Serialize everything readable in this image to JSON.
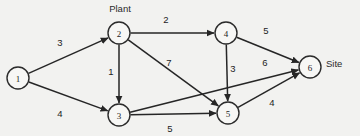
{
  "diagram": {
    "background_color": "#f2f2f0",
    "node_fill": "#f7f7f5",
    "stroke_color": "#262626",
    "annotations": [
      {
        "id": "plant",
        "text": "Plant",
        "x": 120,
        "y": 8
      },
      {
        "id": "site",
        "text": "Site",
        "x": 326,
        "y": 63
      }
    ],
    "nodes": [
      {
        "id": "1",
        "label": "1",
        "x": 18,
        "y": 78,
        "r": 11
      },
      {
        "id": "2",
        "label": "2",
        "x": 119,
        "y": 33,
        "r": 11
      },
      {
        "id": "3",
        "label": "3",
        "x": 119,
        "y": 115,
        "r": 11
      },
      {
        "id": "4",
        "label": "4",
        "x": 226,
        "y": 33,
        "r": 11
      },
      {
        "id": "5",
        "label": "5",
        "x": 228,
        "y": 113,
        "r": 11
      },
      {
        "id": "6",
        "label": "6",
        "x": 310,
        "y": 67,
        "r": 11
      }
    ],
    "edges": [
      {
        "id": "e-1-2",
        "from": "1",
        "to": "2",
        "weight": "3",
        "label_x": 60,
        "label_y": 42
      },
      {
        "id": "e-1-3",
        "from": "1",
        "to": "3",
        "weight": "4",
        "label_x": 60,
        "label_y": 113
      },
      {
        "id": "e-2-4",
        "from": "2",
        "to": "4",
        "weight": "2",
        "label_x": 166,
        "label_y": 19
      },
      {
        "id": "e-2-3",
        "from": "2",
        "to": "3",
        "weight": "1",
        "label_x": 111,
        "label_y": 71
      },
      {
        "id": "e-2-5",
        "from": "2",
        "to": "5",
        "weight": "7",
        "label_x": 169,
        "label_y": 62
      },
      {
        "id": "e-4-5",
        "from": "4",
        "to": "5",
        "weight": "3",
        "label_x": 233,
        "label_y": 68
      },
      {
        "id": "e-4-6",
        "from": "4",
        "to": "6",
        "weight": "5",
        "label_x": 266,
        "label_y": 30
      },
      {
        "id": "e-3-6",
        "from": "3",
        "to": "6",
        "weight": "6",
        "label_x": 265,
        "label_y": 62
      },
      {
        "id": "e-3-5",
        "from": "3",
        "to": "5",
        "weight": "5",
        "label_x": 170,
        "label_y": 128
      },
      {
        "id": "e-5-6",
        "from": "5",
        "to": "6",
        "weight": "4",
        "label_x": 272,
        "label_y": 102
      }
    ]
  }
}
